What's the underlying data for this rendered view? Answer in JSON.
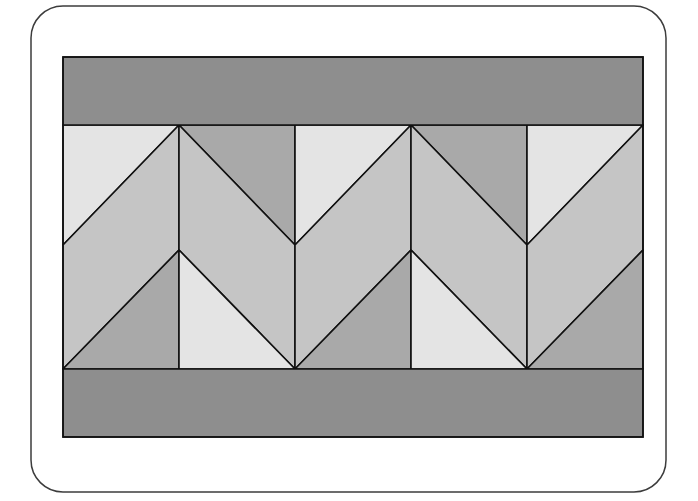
{
  "diagram": {
    "type": "quilt-block-layout",
    "colors": {
      "background": "#ffffff",
      "frame_stroke": "#3c3c3c",
      "seam_stroke": "#111111",
      "band": "#8e8e8e",
      "light": "#e4e4e4",
      "medium": "#c5c5c5",
      "dark": "#a9a9a9"
    },
    "frame": {
      "x": 31,
      "y": 6,
      "width": 635,
      "height": 486,
      "radius": 32
    },
    "quilt": {
      "x": 63,
      "y": 57,
      "width": 580,
      "height": 380
    },
    "top_band": {
      "x": 63,
      "y": 57,
      "width": 580,
      "height": 68
    },
    "bottom_band": {
      "x": 63,
      "y": 369,
      "width": 580,
      "height": 68
    },
    "chevron_row": {
      "y_top": 125,
      "y_bottom": 369,
      "columns": [
        {
          "x0": 63,
          "x1": 179,
          "orientation": "rising",
          "y_left_mid": 245,
          "y_right_mid": 250
        },
        {
          "x0": 179,
          "x1": 295,
          "orientation": "falling",
          "y_left_mid": 250,
          "y_right_mid": 245
        },
        {
          "x0": 295,
          "x1": 411,
          "orientation": "rising",
          "y_left_mid": 245,
          "y_right_mid": 250
        },
        {
          "x0": 411,
          "x1": 527,
          "orientation": "falling",
          "y_left_mid": 250,
          "y_right_mid": 245
        },
        {
          "x0": 527,
          "x1": 643,
          "orientation": "rising",
          "y_left_mid": 245,
          "y_right_mid": 250
        }
      ]
    }
  }
}
